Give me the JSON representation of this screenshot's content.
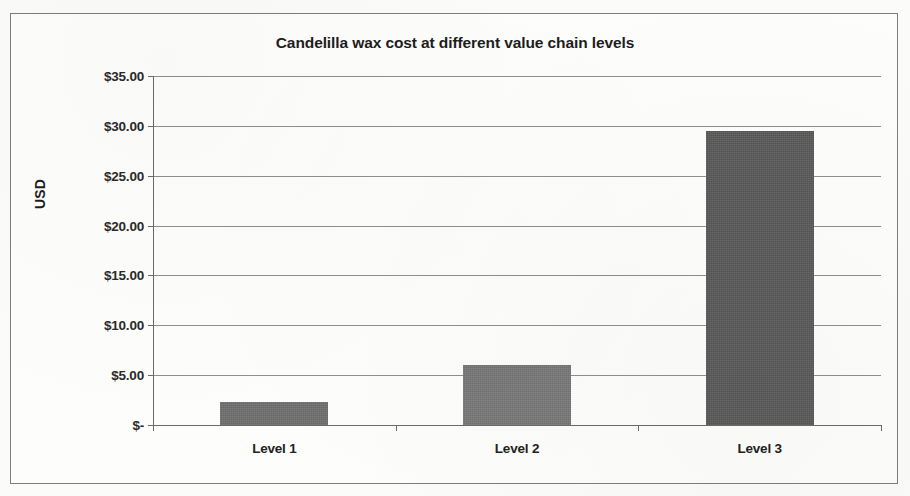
{
  "chart_data": {
    "type": "bar",
    "title": "Candelilla wax cost  at different value chain levels",
    "xlabel": "",
    "ylabel": "USD",
    "categories": [
      "Level 1",
      "Level 2",
      "Level 3"
    ],
    "values": [
      2.3,
      6.0,
      29.5
    ],
    "ylim": [
      0,
      35
    ],
    "ytick_values": [
      0,
      5,
      10,
      15,
      20,
      25,
      30,
      35
    ],
    "ytick_labels": [
      "$-",
      "$5.00",
      "$10.00",
      "$15.00",
      "$20.00",
      "$25.00",
      "$30.00",
      "$35.00"
    ],
    "grid": true,
    "legend": false,
    "series": [
      {
        "name": "Cost",
        "values": [
          2.3,
          6.0,
          29.5
        ]
      }
    ],
    "bar_colors": [
      "#6e6e6e",
      "#787878",
      "#595959"
    ],
    "colors": {
      "plot_background": "#fdfdfc",
      "page_background": "#fbfbfa",
      "gridline": "#8f8f8f",
      "axis": "#6a6a6a",
      "frame_border": "#7d7d7d",
      "title_text": "#1d1d1d",
      "tick_text": "#2a2a2a"
    }
  }
}
